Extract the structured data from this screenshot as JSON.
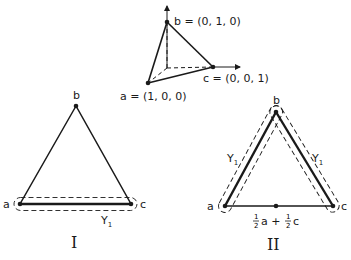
{
  "simplex3d": {
    "label_b": "b = (0, 1, 0)",
    "label_c": "c = (0, 0, 1)",
    "label_a": "a = (1, 0, 0)"
  },
  "panel_I": {
    "vertex_a": "a",
    "vertex_b": "b",
    "vertex_c": "c",
    "set_label": "Y",
    "set_sub": "1",
    "roman": "I"
  },
  "panel_II": {
    "vertex_a": "a",
    "vertex_b": "b",
    "vertex_c": "c",
    "set_label_left": "Y",
    "set_sub_left": "1",
    "set_label_right": "Y",
    "set_sub_right": "1",
    "midpoint_frac1_num": "1",
    "midpoint_frac1_den": "2",
    "midpoint_a": "a +",
    "midpoint_frac2_num": "1",
    "midpoint_frac2_den": "2",
    "midpoint_c": "c",
    "roman": "II"
  },
  "colors": {
    "ink": "#1a1a1a",
    "background": "#ffffff"
  }
}
